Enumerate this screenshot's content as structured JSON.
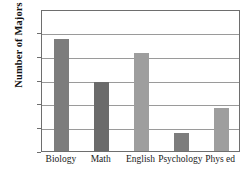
{
  "chart_data": {
    "type": "bar",
    "title": "",
    "title_note": "title row is cropped off the top edge of the screenshot",
    "xlabel": "",
    "ylabel": "Number of Majors",
    "categories": [
      "Biology",
      "Math",
      "English",
      "Psychology",
      "Phys ed"
    ],
    "values": [
      95,
      58,
      83,
      15,
      36
    ],
    "ylim": [
      0,
      120
    ],
    "y_ticks": [
      0,
      20,
      40,
      60,
      80,
      100,
      120
    ],
    "y_tick_labels": [
      "0",
      "20",
      "40",
      "60",
      "80",
      "100",
      "120"
    ],
    "grid": "horizontal",
    "legend": "none",
    "bar_colors": [
      "#7d7d7d",
      "#6b6b6b",
      "#9e9e9e",
      "#7d7d7d",
      "#9e9e9e"
    ],
    "series": [
      {
        "name": "Number of Majors",
        "values": [
          95,
          58,
          83,
          15,
          36
        ]
      }
    ]
  },
  "style": {
    "axis_color": "#6e6e6e",
    "grid_color": "#9a9a9a",
    "text_color": "#1a1a1a",
    "background": "#ffffff"
  }
}
